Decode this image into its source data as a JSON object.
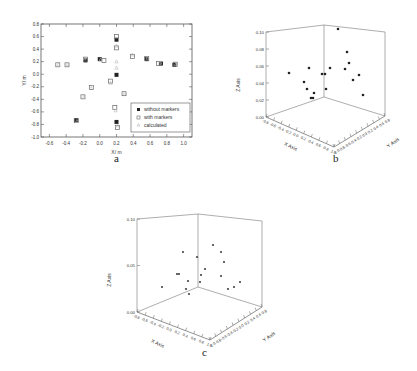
{
  "captions": {
    "a": "a",
    "b": "b",
    "c": "c"
  },
  "chart_data": [
    {
      "id": "a",
      "type": "scatter",
      "title": "",
      "xlabel": "X/ m",
      "ylabel": "Y/ m",
      "xlim": [
        -0.7,
        1.1
      ],
      "ylim": [
        -1.0,
        0.8
      ],
      "xticks": [
        "-0.6",
        "-0.4",
        "-0.2",
        "0.0",
        "0.2",
        "0.4",
        "0.6",
        "0.8",
        "1.0"
      ],
      "yticks": [
        "-1.0",
        "-0.8",
        "-0.6",
        "-0.4",
        "-0.2",
        "0.0",
        "0.2",
        "0.4",
        "0.6",
        "0.8"
      ],
      "legend": {
        "position": "lower right",
        "entries": [
          "without markers",
          "with markers",
          "calculated"
        ]
      },
      "grid": false,
      "series": [
        {
          "name": "without markers",
          "marker": "filled-square",
          "points": [
            [
              -0.28,
              -0.73
            ],
            [
              -0.17,
              0.22
            ],
            [
              0.0,
              0.24
            ],
            [
              0.2,
              0.55
            ],
            [
              0.2,
              -0.01
            ],
            [
              0.2,
              -0.76
            ],
            [
              0.56,
              0.24
            ],
            [
              0.73,
              0.17
            ],
            [
              0.89,
              0.15
            ]
          ]
        },
        {
          "name": "with markers",
          "marker": "open-square",
          "points": [
            [
              -0.5,
              0.15
            ],
            [
              -0.39,
              0.15
            ],
            [
              -0.2,
              -0.36
            ],
            [
              -0.1,
              -0.21
            ],
            [
              -0.17,
              0.24
            ],
            [
              0.05,
              0.22
            ],
            [
              0.13,
              -0.11
            ],
            [
              0.18,
              -0.53
            ],
            [
              0.2,
              0.42
            ],
            [
              0.2,
              0.6
            ],
            [
              0.29,
              -0.31
            ],
            [
              0.39,
              0.28
            ],
            [
              0.56,
              0.25
            ],
            [
              0.7,
              0.17
            ],
            [
              0.9,
              0.16
            ],
            [
              0.21,
              -0.85
            ],
            [
              -0.28,
              -0.74
            ]
          ]
        },
        {
          "name": "calculated",
          "marker": "small-triangle",
          "points": [
            [
              -0.49,
              0.15
            ],
            [
              -0.38,
              0.16
            ],
            [
              -0.19,
              -0.37
            ],
            [
              -0.09,
              -0.2
            ],
            [
              -0.18,
              0.25
            ],
            [
              0.01,
              0.23
            ],
            [
              0.13,
              -0.14
            ],
            [
              0.2,
              0.1
            ],
            [
              0.19,
              -0.58
            ],
            [
              0.2,
              0.45
            ],
            [
              0.3,
              -0.3
            ],
            [
              0.39,
              0.31
            ],
            [
              0.57,
              0.26
            ],
            [
              0.72,
              0.18
            ],
            [
              0.91,
              0.16
            ],
            [
              0.21,
              -0.82
            ],
            [
              -0.27,
              -0.75
            ],
            [
              0.2,
              0.2
            ]
          ]
        }
      ]
    },
    {
      "id": "b",
      "type": "scatter3d",
      "xlabel": "X Axis",
      "ylabel": "Y Axis",
      "zlabel": "Z Axis",
      "xlim": [
        -0.8,
        1.0
      ],
      "ylim": [
        -1.0,
        0.8
      ],
      "zlim": [
        0.0,
        0.1
      ],
      "xticks": [
        "-0.8",
        "-0.6",
        "-0.4",
        "-0.2",
        "0.0",
        "0.2",
        "0.4",
        "0.6",
        "0.8",
        "1.0"
      ],
      "yticks": [
        "-1.0",
        "-0.8",
        "-0.6",
        "-0.4",
        "-0.2",
        "0.0",
        "0.2",
        "0.4",
        "0.6",
        "0.8"
      ],
      "zticks": [
        "0.00",
        "0.02",
        "0.04",
        "0.06",
        "0.08",
        "0.10"
      ],
      "screen_points": [
        [
          79,
          73
        ],
        [
          99,
          68
        ],
        [
          94,
          82
        ],
        [
          97,
          89
        ],
        [
          104,
          93
        ],
        [
          101,
          98
        ],
        [
          103,
          98
        ],
        [
          112,
          74
        ],
        [
          115,
          74
        ],
        [
          120,
          68
        ],
        [
          116,
          89
        ],
        [
          128,
          29
        ],
        [
          137,
          52
        ],
        [
          139,
          63
        ],
        [
          135,
          69
        ],
        [
          143,
          80
        ],
        [
          149,
          75
        ],
        [
          153,
          95
        ]
      ]
    },
    {
      "id": "c",
      "type": "scatter3d",
      "xlabel": "X Axis",
      "ylabel": "Y Axis",
      "zlabel": "Z Axis",
      "xlim": [
        -0.8,
        1.0
      ],
      "ylim": [
        -1.0,
        0.8
      ],
      "zlim": [
        0.0,
        0.1
      ],
      "xticks": [
        "-0.8",
        "-0.6",
        "-0.4",
        "-0.2",
        "0.0",
        "0.2",
        "0.4",
        "0.6",
        "0.8",
        "1.0"
      ],
      "yticks": [
        "-1.0",
        "-0.8",
        "-0.6",
        "-0.4",
        "-0.2",
        "0.0",
        "0.2",
        "0.4",
        "0.6",
        "0.8"
      ],
      "zticks": [
        "0.00",
        "0.05",
        "0.10"
      ],
      "screen_points": [
        [
          62,
          97
        ],
        [
          83,
          62
        ],
        [
          77,
          84
        ],
        [
          79,
          84
        ],
        [
          88,
          91
        ],
        [
          86,
          99
        ],
        [
          89,
          104
        ],
        [
          97,
          67
        ],
        [
          105,
          79
        ],
        [
          101,
          85
        ],
        [
          100,
          92
        ],
        [
          113,
          55
        ],
        [
          121,
          62
        ],
        [
          124,
          72
        ],
        [
          121,
          86
        ],
        [
          128,
          99
        ],
        [
          134,
          97
        ],
        [
          140,
          92
        ]
      ]
    }
  ]
}
